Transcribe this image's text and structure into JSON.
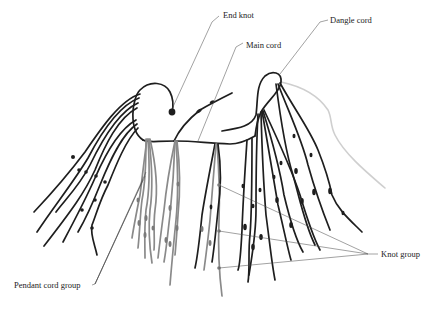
{
  "figure": {
    "labels": {
      "end_knot": "End knot",
      "dangle_cord": "Dangle cord",
      "main_cord": "Main cord",
      "knot_group": "Knot group",
      "pendant_cord_group": "Pendant cord group"
    },
    "colors": {
      "dark_cords": "#1e1e1e",
      "grey_cords": "#8a8a8a",
      "dangle_cord": "#cfcfcf",
      "leader_lines": "#444444",
      "background": "#ffffff"
    }
  }
}
